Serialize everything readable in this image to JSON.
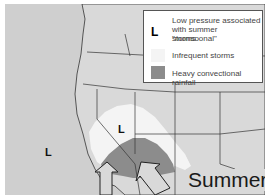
{
  "map": {
    "season_label": "Summer",
    "colors": {
      "land": "#d9d9d9",
      "ocean": "#cfcfcf",
      "infrequent": "#f4f4f4",
      "heavy": "#8c8c8c",
      "borders": "#333333"
    },
    "low_pressure_markers": [
      {
        "label": "L",
        "location": "Pacific Ocean"
      },
      {
        "label": "L",
        "location": "Nevada"
      }
    ],
    "arrows": [
      "moisture-arrow-gulf-of-california",
      "moisture-arrow-southwest"
    ]
  },
  "legend": {
    "items": [
      {
        "symbol": "L",
        "text_line1": "Low pressure associated",
        "text_line2": "with summer \"monsoonal\"",
        "text_line3": "storms"
      },
      {
        "swatch": "#f4f4f4",
        "text": "Infrequent storms"
      },
      {
        "swatch": "#8c8c8c",
        "text": "Heavy convectional rainfall"
      }
    ]
  }
}
